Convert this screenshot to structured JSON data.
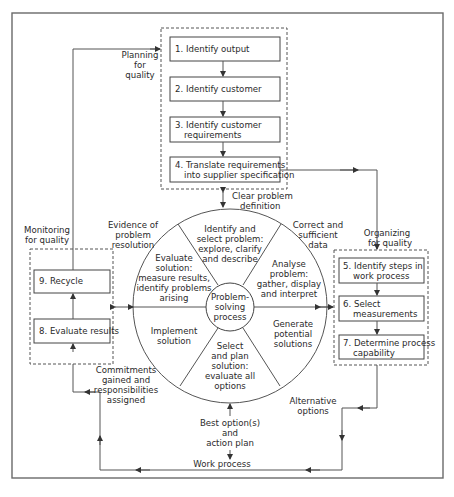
{
  "diagram": {
    "groups": {
      "planning": {
        "label_lines": [
          "Planning",
          "for",
          "quality"
        ],
        "steps": [
          {
            "lines": [
              "1.  Identify output"
            ]
          },
          {
            "lines": [
              "2.  Identify customer"
            ]
          },
          {
            "lines": [
              "3.  Identify customer",
              "requirements"
            ]
          },
          {
            "lines": [
              "4.  Translate requirements",
              "into supplier specification"
            ]
          }
        ]
      },
      "organizing": {
        "label_lines": [
          "Organizing",
          "for quality"
        ],
        "steps": [
          {
            "lines": [
              "5.  Identify steps in",
              "work process"
            ]
          },
          {
            "lines": [
              "6.  Select",
              "measurements"
            ]
          },
          {
            "lines": [
              "7.  Determine process",
              "capability"
            ]
          }
        ]
      },
      "monitoring": {
        "label_lines": [
          "Monitoring",
          "for quality"
        ],
        "steps": [
          {
            "lines": [
              "9.  Recycle"
            ]
          },
          {
            "lines": [
              "8.  Evaluate results"
            ]
          }
        ]
      }
    },
    "wheel": {
      "center_lines": [
        "Problem-",
        "solving",
        "process"
      ],
      "segments": {
        "identify": [
          "Identify and",
          "select problem:",
          "explore, clarify",
          "and describe"
        ],
        "analyse": [
          "Analyse",
          "problem:",
          "gather, display",
          "and interpret"
        ],
        "generate": [
          "Generate",
          "potential",
          "solutions"
        ],
        "select_plan": [
          "Select",
          "and plan",
          "solution:",
          "evaluate all",
          "options"
        ],
        "implement": [
          "Implement",
          "solution"
        ],
        "evaluate": [
          "Evaluate",
          "solution:",
          "measure results,",
          "identify problems",
          "arising"
        ]
      }
    },
    "connectors": {
      "clear_problem": [
        "Clear problem",
        "definition"
      ],
      "correct_data": [
        "Correct and",
        "sufficient",
        "data"
      ],
      "alternative": [
        "Alternative",
        "options"
      ],
      "best_option": [
        "Best option(s)",
        "and",
        "action plan"
      ],
      "work_process": [
        "Work process"
      ],
      "commitments": [
        "Commitments",
        "gained and",
        "responsibilities",
        "assigned"
      ],
      "evidence": [
        "Evidence of",
        "problem",
        "resolution"
      ]
    },
    "colors": {
      "line": "#555555",
      "frame": "#6a6a6a",
      "text": "#2a2a2a"
    }
  }
}
